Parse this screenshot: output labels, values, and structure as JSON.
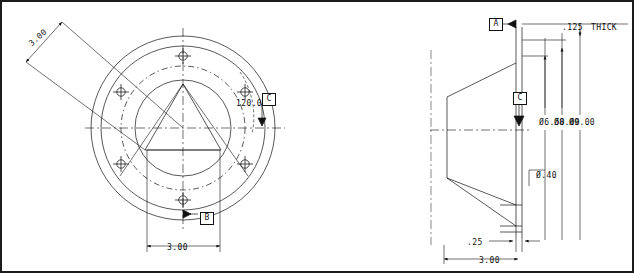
{
  "sheet": {
    "border_color": "#1b1b1b",
    "background": "#ffffff",
    "line_color": "#111111"
  },
  "views": {
    "front": {
      "name": "front-view",
      "label": "Front View (circular flange)",
      "center": {
        "x": 183,
        "y": 128
      },
      "circles": [
        {
          "name": "outer-diameter",
          "r": 92
        },
        {
          "name": "second-diameter",
          "r": 82
        },
        {
          "name": "bolt-circle",
          "r": 62
        },
        {
          "name": "inner-bore",
          "r": 48
        }
      ],
      "bolt_hole_count": 6,
      "bolt_hole_radius": 72,
      "triangle_label": "inscribed-triangle"
    },
    "side": {
      "name": "side-section-view",
      "label": "Side Section View (tapered cone)",
      "axis_x": 519,
      "top_y": 27,
      "bottom_y": 238
    }
  },
  "dimensions": [
    {
      "id": "d1",
      "name": "dim-bolt-circle-3-00",
      "value": "3.00",
      "x": 30,
      "y": 40
    },
    {
      "id": "d2",
      "name": "dim-angle-120-00",
      "value": "120.00",
      "x": 236,
      "y": 99
    },
    {
      "id": "d3",
      "name": "dim-width-3-00",
      "value": "3.00",
      "x": 167,
      "y": 243
    },
    {
      "id": "d4",
      "name": "dim-thickness-125",
      "value": ".125",
      "x": 562,
      "y": 23
    },
    {
      "id": "d5",
      "name": "dim-thick-note",
      "value": "THICK",
      "x": 591,
      "y": 23
    },
    {
      "id": "d6",
      "name": "dim-diameter-6-50",
      "value": "Ø6.50",
      "x": 539,
      "y": 118
    },
    {
      "id": "d7",
      "name": "dim-diameter-8-00",
      "value": "Ø8.00",
      "x": 554,
      "y": 118
    },
    {
      "id": "d8",
      "name": "dim-diameter-9-00",
      "value": "Ø9.00",
      "x": 569,
      "y": 118
    },
    {
      "id": "d9",
      "name": "dim-hole-diameter-40",
      "value": "Ø.40",
      "x": 536,
      "y": 171
    },
    {
      "id": "d10",
      "name": "dim-depth-25",
      "value": ".25",
      "x": 467,
      "y": 238
    },
    {
      "id": "d11",
      "name": "dim-overall-3-00",
      "value": "3.00",
      "x": 479,
      "y": 256
    }
  ],
  "datums": [
    {
      "id": "datum-a",
      "name": "datum-flag-a",
      "letter": "A",
      "x": 489,
      "y": 18
    },
    {
      "id": "datum-b",
      "name": "datum-flag-b",
      "letter": "B",
      "x": 200,
      "y": 212
    },
    {
      "id": "datum-c",
      "name": "datum-flag-c",
      "letter": "C",
      "x": 268,
      "y": 94
    },
    {
      "id": "datum-c2",
      "name": "datum-flag-c-side",
      "letter": "C",
      "x": 513,
      "y": 93
    }
  ]
}
